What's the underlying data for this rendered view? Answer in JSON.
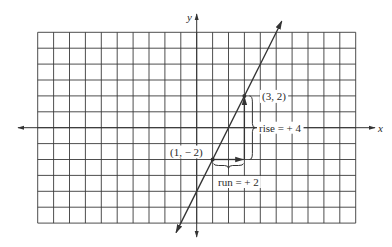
{
  "diagram": {
    "colors": {
      "background": "#ffffff",
      "grid": "#3a3a3a",
      "axis": "#333333",
      "line": "#333333",
      "text": "#2a2a2a"
    },
    "grid": {
      "x_range": [
        -10,
        10
      ],
      "y_range": [
        -6,
        6
      ],
      "step": 1
    },
    "axes": {
      "x_label": "x",
      "y_label": "y"
    },
    "line": {
      "slope": 2,
      "intercept": -4,
      "equation": "y = 2x - 4"
    },
    "points": [
      {
        "x": 1,
        "y": -2,
        "label": "(1, − 2)"
      },
      {
        "x": 3,
        "y": 2,
        "label": "(3, 2)"
      }
    ],
    "annotations": {
      "rise": "rise = + 4",
      "run": "run = + 2"
    }
  },
  "chart_data": {
    "type": "line",
    "title": "",
    "xlabel": "x",
    "ylabel": "y",
    "xlim": [
      -10,
      10
    ],
    "ylim": [
      -6,
      6
    ],
    "grid": true,
    "series": [
      {
        "name": "y = 2x - 4",
        "x": [
          -1.25,
          5.25
        ],
        "y": [
          -6.5,
          6.5
        ]
      }
    ],
    "points": [
      {
        "x": 1,
        "y": -2,
        "label": "(1, − 2)"
      },
      {
        "x": 3,
        "y": 2,
        "label": "(3, 2)"
      }
    ],
    "annotations": [
      {
        "text": "rise = + 4",
        "from": [
          3,
          -2
        ],
        "to": [
          3,
          2
        ]
      },
      {
        "text": "run = + 2",
        "from": [
          1,
          -2
        ],
        "to": [
          3,
          -2
        ]
      }
    ]
  }
}
